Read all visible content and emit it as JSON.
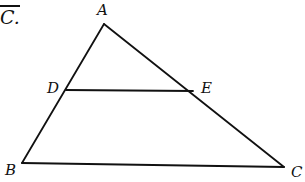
{
  "header_fragment": {
    "text": "C.",
    "overline": true
  },
  "diagram": {
    "stroke_color": "#111111",
    "stroke_width": 1.8,
    "points": {
      "A": {
        "label": "A",
        "x": 104,
        "y": 24
      },
      "B": {
        "label": "B",
        "x": 22,
        "y": 163
      },
      "C": {
        "label": "C",
        "x": 284,
        "y": 167
      },
      "D": {
        "label": "D",
        "x": 66,
        "y": 90
      },
      "E": {
        "label": "E",
        "x": 193,
        "y": 91
      }
    },
    "segments": [
      [
        "A",
        "B"
      ],
      [
        "A",
        "C"
      ],
      [
        "B",
        "C"
      ],
      [
        "D",
        "E"
      ]
    ],
    "labels": {
      "A": "A",
      "B": "B",
      "C": "C",
      "D": "D",
      "E": "E"
    }
  }
}
